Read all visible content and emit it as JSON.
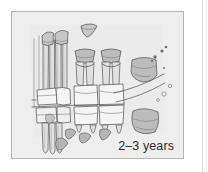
{
  "figure": {
    "caption": "2–3 years",
    "panel": {
      "background_color": "#eeeeee",
      "border_color": "#b4b4b4"
    },
    "colors": {
      "page_background": "#ffffff",
      "panel_background": "#eeeeee",
      "panel_border": "#b4b4b4",
      "outline": "#555555",
      "outline_light": "#7d7d7d",
      "bone_fill": "#e2e2e2",
      "tooth_fill": "#f4f4f4",
      "crown_fill": "#c9c9c9",
      "crypt_fill": "#bdbdbd",
      "root_fill": "#d2d2d2",
      "speck": "#6e6e6e",
      "caption_text": "#2b2b2b",
      "page_rule": "#d9d9d9"
    },
    "elements": {
      "erupted_teeth_label": "erupted deciduous teeth",
      "developing_crypts_label": "developing permanent tooth crypts",
      "mandibular_canal_label": "mandibular canal",
      "shed_tooth_label": "isolated crown",
      "molar_bud_label": "permanent molar bud"
    }
  }
}
